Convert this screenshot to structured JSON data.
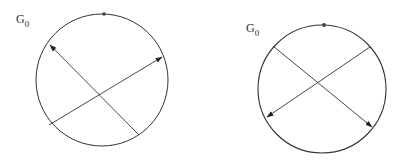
{
  "panels": [
    {
      "label_main": "G",
      "label_sub": "0",
      "circle": {
        "cx": 102,
        "cy": 80,
        "r": 66
      },
      "marker": {
        "x": 104,
        "y": 14
      },
      "arrows": [
        {
          "from": [
            139,
            135
          ],
          "to": [
            50,
            45
          ]
        },
        {
          "from": [
            49,
            125
          ],
          "to": [
            162,
            57
          ]
        }
      ]
    },
    {
      "label_main": "G",
      "label_sub": "0",
      "circle": {
        "cx": 322,
        "cy": 89,
        "r": 64
      },
      "marker": {
        "x": 324,
        "y": 25
      },
      "arrows": [
        {
          "from": [
            273,
            46
          ],
          "to": [
            372,
            127
          ]
        },
        {
          "from": [
            370,
            47
          ],
          "to": [
            267,
            117
          ]
        }
      ]
    }
  ],
  "colors": {
    "stroke": "#333333",
    "background": "#ffffff"
  }
}
